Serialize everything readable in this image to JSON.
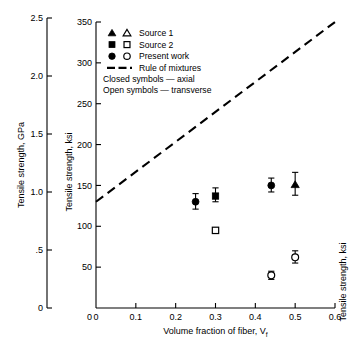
{
  "chart_data": {
    "type": "scatter",
    "title": "",
    "xlabel": "Volume fraction of fiber, V",
    "xlabel_sub": "f",
    "ylabel_left": "Tensile strength, GPa",
    "ylabel_inner": "Tensile strength, ksi",
    "ylabel_right": "Tensile strength, ksi",
    "xlim": [
      0,
      0.6
    ],
    "ylim_ksi": [
      0,
      350
    ],
    "ylim_gpa": [
      0,
      2.5
    ],
    "grid": false,
    "legend_position": "upper-left-inside",
    "xticks": [
      "0",
      "0.1",
      "0.2",
      "0.3",
      "0.4",
      "0.5",
      "0.6"
    ],
    "xtick_values": [
      0,
      0.1,
      0.2,
      0.3,
      0.4,
      0.5,
      0.6
    ],
    "yticks_ksi": [
      "0",
      "50",
      "100",
      "150",
      "200",
      "250",
      "300",
      "350"
    ],
    "ytick_values_ksi": [
      0,
      50,
      100,
      150,
      200,
      250,
      300,
      350
    ],
    "yticks_gpa": [
      "0",
      ".5",
      "1.0",
      "1.5",
      "2.0",
      "2.5"
    ],
    "ytick_values_gpa": [
      0,
      0.5,
      1.0,
      1.5,
      2.0,
      2.5
    ],
    "legend": [
      {
        "label": "Source 1",
        "closed_marker": "triangle",
        "open_marker": "triangle"
      },
      {
        "label": "Source 2",
        "closed_marker": "square",
        "open_marker": "square"
      },
      {
        "label": "Present work",
        "closed_marker": "circle",
        "open_marker": "circle"
      },
      {
        "label": "Rule of mixtures",
        "closed_marker": "dashed-line",
        "open_marker": ""
      }
    ],
    "legend_notes": [
      "Closed symbols — axial",
      "Open symbols — transverse"
    ],
    "series": [
      {
        "name": "Rule of mixtures",
        "type": "line",
        "style": "dashed",
        "x": [
          0,
          0.6
        ],
        "y_ksi": [
          130,
          350
        ]
      },
      {
        "name": "Present work — axial (closed circles)",
        "type": "scatter",
        "marker": "circle-filled",
        "points": [
          {
            "x": 0.25,
            "y_ksi": 130,
            "err_low": 121,
            "err_high": 140
          },
          {
            "x": 0.44,
            "y_ksi": 150,
            "err_low": 142,
            "err_high": 159
          }
        ]
      },
      {
        "name": "Source 2 — axial (closed square)",
        "type": "scatter",
        "marker": "square-filled",
        "points": [
          {
            "x": 0.3,
            "y_ksi": 137,
            "err_low": 130,
            "err_high": 147
          }
        ]
      },
      {
        "name": "Source 1 — axial (closed triangle)",
        "type": "scatter",
        "marker": "triangle-filled",
        "points": [
          {
            "x": 0.5,
            "y_ksi": 151,
            "err_low": 138,
            "err_high": 166
          }
        ]
      },
      {
        "name": "Source 2 — transverse (open square)",
        "type": "scatter",
        "marker": "square-open",
        "points": [
          {
            "x": 0.3,
            "y_ksi": 95,
            "err_low": 95,
            "err_high": 95
          }
        ]
      },
      {
        "name": "Present work — transverse (open circles)",
        "type": "scatter",
        "marker": "circle-open",
        "points": [
          {
            "x": 0.44,
            "y_ksi": 40,
            "err_low": 35,
            "err_high": 45
          },
          {
            "x": 0.5,
            "y_ksi": 62,
            "err_low": 55,
            "err_high": 70
          }
        ]
      }
    ]
  }
}
